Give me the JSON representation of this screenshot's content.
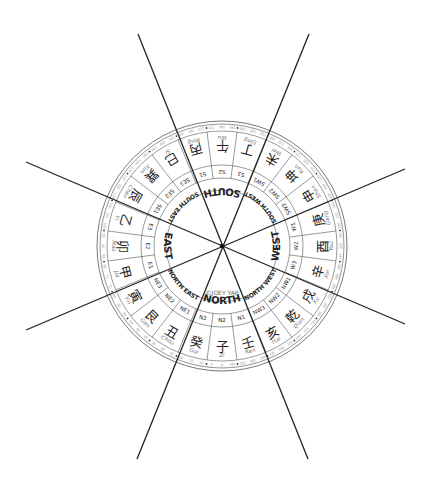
{
  "diagram": {
    "copyright": "©JOEY YAP",
    "center": [
      222,
      246
    ],
    "radii": {
      "outer": 125,
      "degree_inner": 115,
      "char_inner": 81,
      "sub_inner": 68,
      "dir_inner": 56
    },
    "colors": {
      "line": "#222222",
      "ring": "#555555",
      "text": "#222222",
      "pinyin": "#777777",
      "degree_text": "#888888"
    },
    "lines": [
      {
        "x1": 138,
        "y1": 34,
        "x2": 308,
        "y2": 459
      },
      {
        "x1": 309,
        "y1": 34,
        "x2": 137,
        "y2": 459
      },
      {
        "x1": 26,
        "y1": 162,
        "x2": 405,
        "y2": 324
      },
      {
        "x1": 26,
        "y1": 330,
        "x2": 405,
        "y2": 169
      }
    ],
    "directions": [
      {
        "name": "NORTH",
        "angle": 0
      },
      {
        "name": "NORTH EAST",
        "angle": 45
      },
      {
        "name": "EAST",
        "angle": 90
      },
      {
        "name": "SOUTH EAST",
        "angle": 135
      },
      {
        "name": "SOUTH",
        "angle": 180
      },
      {
        "name": "SOUTH WEST",
        "angle": 225
      },
      {
        "name": "WEST",
        "angle": 270
      },
      {
        "name": "NORTH WEST",
        "angle": 315
      }
    ],
    "mountains": [
      {
        "code": "N2",
        "char": "子",
        "pinyin": "Zi",
        "angle": 0
      },
      {
        "code": "N3",
        "char": "癸",
        "pinyin": "Gui",
        "angle": 15
      },
      {
        "code": "NE1",
        "char": "丑",
        "pinyin": "Chou",
        "angle": 30
      },
      {
        "code": "NE2",
        "char": "艮",
        "pinyin": "Gen",
        "angle": 45
      },
      {
        "code": "NE3",
        "char": "寅",
        "pinyin": "Yin",
        "angle": 60
      },
      {
        "code": "E1",
        "char": "甲",
        "pinyin": "Jia",
        "angle": 75
      },
      {
        "code": "E2",
        "char": "卯",
        "pinyin": "Mao",
        "angle": 90
      },
      {
        "code": "E3",
        "char": "乙",
        "pinyin": "Yi",
        "angle": 105
      },
      {
        "code": "SE1",
        "char": "辰",
        "pinyin": "Chen",
        "angle": 120
      },
      {
        "code": "SE2",
        "char": "巽",
        "pinyin": "Xun",
        "angle": 135
      },
      {
        "code": "SE3",
        "char": "巳",
        "pinyin": "Si",
        "angle": 150
      },
      {
        "code": "S1",
        "char": "丙",
        "pinyin": "Bing",
        "angle": 165
      },
      {
        "code": "S2",
        "char": "午",
        "pinyin": "Wu",
        "angle": 180
      },
      {
        "code": "S3",
        "char": "丁",
        "pinyin": "Ding",
        "angle": 195
      },
      {
        "code": "SW1",
        "char": "未",
        "pinyin": "Wei",
        "angle": 210
      },
      {
        "code": "SW2",
        "char": "坤",
        "pinyin": "Kun",
        "angle": 225
      },
      {
        "code": "SW3",
        "char": "申",
        "pinyin": "Shen",
        "angle": 240
      },
      {
        "code": "W1",
        "char": "庚",
        "pinyin": "Geng",
        "angle": 255
      },
      {
        "code": "W2",
        "char": "酉",
        "pinyin": "You",
        "angle": 270
      },
      {
        "code": "W3",
        "char": "辛",
        "pinyin": "Xin",
        "angle": 285
      },
      {
        "code": "NW1",
        "char": "戌",
        "pinyin": "Xu",
        "angle": 300
      },
      {
        "code": "NW2",
        "char": "乾",
        "pinyin": "Qian",
        "angle": 315
      },
      {
        "code": "NW3",
        "char": "亥",
        "pinyin": "Hai",
        "angle": 330
      },
      {
        "code": "N1",
        "char": "壬",
        "pinyin": "Ren",
        "angle": 345
      }
    ]
  }
}
